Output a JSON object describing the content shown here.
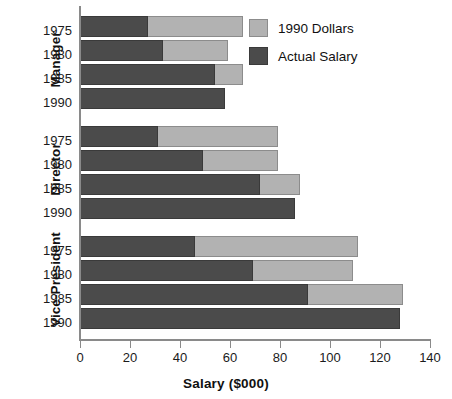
{
  "chart_data": {
    "type": "bar",
    "orientation": "horizontal",
    "stacked_overlay": true,
    "title": "",
    "xlabel": "Salary ($000)",
    "ylabel": "",
    "xlim": [
      0,
      140
    ],
    "xticks": [
      0,
      20,
      40,
      60,
      80,
      100,
      120,
      140
    ],
    "xtick_labels": [
      "0",
      "20",
      "40",
      "60",
      "80",
      "100",
      "120",
      "140"
    ],
    "grid": false,
    "legend_position": "top-right",
    "series": [
      {
        "name": "1990 Dollars",
        "color": "#b2b2b2"
      },
      {
        "name": "Actual Salary",
        "color": "#4b4b4b"
      }
    ],
    "groups": [
      {
        "name": "Manager",
        "categories": [
          "1975",
          "1980",
          "1985",
          "1990"
        ],
        "actual_salary": [
          27,
          33,
          54,
          58
        ],
        "dollars_1990": [
          65,
          59,
          65,
          58
        ]
      },
      {
        "name": "Director",
        "categories": [
          "1975",
          "1980",
          "1985",
          "1990"
        ],
        "actual_salary": [
          31,
          49,
          72,
          86
        ],
        "dollars_1990": [
          79,
          79,
          88,
          86
        ]
      },
      {
        "name": "Vice-President",
        "categories": [
          "1975",
          "1980",
          "1985",
          "1990"
        ],
        "actual_salary": [
          46,
          69,
          91,
          128
        ],
        "dollars_1990": [
          111,
          109,
          129,
          128
        ]
      }
    ]
  },
  "legend": {
    "items": [
      {
        "label": "1990 Dollars",
        "swatch": "light"
      },
      {
        "label": "Actual Salary",
        "swatch": "dark"
      }
    ]
  },
  "axis": {
    "x_title": "Salary ($000)"
  }
}
